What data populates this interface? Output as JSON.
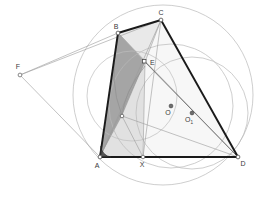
{
  "figure": {
    "width": 275,
    "height": 201,
    "background": "#ffffff"
  },
  "colors": {
    "stroke_heavy": "#1a1a1a",
    "stroke_medium": "#4a4a4a",
    "stroke_light": "#9a9a9a",
    "circle_stroke": "#b0b0b0",
    "fill_dark": "#8c8c8c",
    "fill_mid": "#c9c9c9",
    "fill_light": "#e3e3e3",
    "fill_pale": "#f0f0f0",
    "point_fill": "#ffffff",
    "point_stroke": "#555555",
    "label_color": "#3a3a3a"
  },
  "points": [
    {
      "id": "A",
      "label": "A",
      "x": 100,
      "y": 157,
      "label_dx": -3,
      "label_dy": 11
    },
    {
      "id": "B",
      "label": "B",
      "x": 118,
      "y": 33,
      "label_dx": -2,
      "label_dy": -4
    },
    {
      "id": "C",
      "label": "C",
      "x": 161,
      "y": 20,
      "label_dx": 0,
      "label_dy": -5
    },
    {
      "id": "D",
      "label": "D",
      "x": 238,
      "y": 157,
      "label_dx": 5,
      "label_dy": 9
    },
    {
      "id": "E",
      "label": "E",
      "x": 145,
      "y": 62,
      "label_dx": 5,
      "label_dy": 3
    },
    {
      "id": "F",
      "label": "F",
      "x": 20,
      "y": 75,
      "label_dx": -2,
      "label_dy": -6
    },
    {
      "id": "X",
      "label": "X",
      "x": 143,
      "y": 157,
      "label_dx": -1,
      "label_dy": 10
    },
    {
      "id": "O",
      "label": "O",
      "x": 171,
      "y": 106,
      "label_dx": -3,
      "label_dy": 9
    },
    {
      "id": "O1",
      "label": "O",
      "sub": "1",
      "x": 192,
      "y": 113,
      "label_dx": -3,
      "label_dy": 9
    },
    {
      "id": "G",
      "label": "",
      "x": 122,
      "y": 116,
      "label_dx": 0,
      "label_dy": 0
    }
  ],
  "segments": [
    {
      "name": "AB",
      "from": "A",
      "to": "B",
      "weight": "heavy"
    },
    {
      "name": "BC",
      "from": "B",
      "to": "C",
      "weight": "heavy"
    },
    {
      "name": "CD",
      "from": "C",
      "to": "D",
      "weight": "heavy"
    },
    {
      "name": "AD",
      "from": "A",
      "to": "D",
      "weight": "heavy"
    },
    {
      "name": "BE",
      "from": "B",
      "to": "E",
      "weight": "light"
    },
    {
      "name": "CE",
      "from": "C",
      "to": "E",
      "weight": "light"
    },
    {
      "name": "AE",
      "from": "A",
      "to": "E",
      "weight": "light"
    },
    {
      "name": "ED",
      "from": "E",
      "to": "D",
      "weight": "medium"
    },
    {
      "name": "EX",
      "from": "E",
      "to": "X",
      "weight": "light"
    },
    {
      "name": "CX",
      "from": "C",
      "to": "X",
      "weight": "light"
    },
    {
      "name": "FB",
      "from": "F",
      "to": "B",
      "weight": "light"
    },
    {
      "name": "FA",
      "from": "F",
      "to": "A",
      "weight": "light"
    },
    {
      "name": "FC",
      "from": "F",
      "to": "C",
      "weight": "light"
    },
    {
      "name": "GD",
      "from": "G",
      "to": "D",
      "weight": "light"
    },
    {
      "name": "BD",
      "from": "B",
      "to": "D",
      "weight": "light"
    },
    {
      "name": "AC",
      "from": "A",
      "to": "C",
      "weight": "light"
    }
  ],
  "circles": [
    {
      "name": "circumcircle-ABCD",
      "cx": 163,
      "cy": 95,
      "r": 90
    },
    {
      "name": "circle-O",
      "cx": 171,
      "cy": 106,
      "r": 62
    },
    {
      "name": "circle-O1",
      "cx": 192,
      "cy": 113,
      "r": 56
    },
    {
      "name": "circle-small-left",
      "cx": 132,
      "cy": 96,
      "r": 45
    }
  ],
  "arcs": [
    {
      "name": "arc-angle-A",
      "d": "M 108 157 A 9 9 0 0 1 102 148",
      "weight": "heavy"
    },
    {
      "name": "arc-BE-inner",
      "d": "M 118 38 Q 110 80 122 116",
      "weight": "light"
    },
    {
      "name": "arc-EA-inner",
      "d": "M 145 66 Q 126 92 122 116",
      "weight": "light"
    }
  ],
  "regions": [
    {
      "name": "region-ABE-dark",
      "poly": "118,33 145,62 122,116 100,157",
      "fill": "fill_dark",
      "opacity": 0.72
    },
    {
      "name": "region-AEX-mid",
      "poly": "100,157 122,116 145,62 143,157",
      "fill": "fill_mid",
      "opacity": 0.55
    },
    {
      "name": "region-BCE-light",
      "poly": "118,33 161,20 145,62",
      "fill": "fill_light",
      "opacity": 0.75
    },
    {
      "name": "region-A-corner",
      "poly": "100,157 104,146 112,155 108,160",
      "fill": "stroke_heavy",
      "opacity": 0.85
    }
  ],
  "labels": {
    "A": "A",
    "B": "B",
    "C": "C",
    "D": "D",
    "E": "E",
    "F": "F",
    "X": "X",
    "O": "O",
    "O1": "O",
    "O1_sub": "1"
  }
}
